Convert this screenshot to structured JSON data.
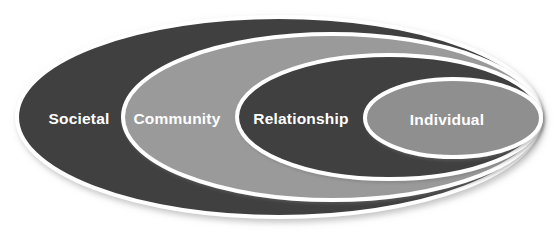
{
  "diagram": {
    "name": "social-ecological-model",
    "background_color": "#ffffff",
    "outline_color": "#ffffff",
    "shadow_color": "#b9b9b9",
    "levels": [
      {
        "label": "Societal",
        "fill": "#3f3f3f",
        "order": 1,
        "scope": "outermost",
        "cx": 279,
        "cy": 117,
        "rx": 262,
        "ry": 100,
        "label_x": 79,
        "label_y": 120
      },
      {
        "label": "Community",
        "fill": "#9a9a9a",
        "order": 2,
        "scope": "second",
        "cx": 332,
        "cy": 117,
        "rx": 209,
        "ry": 83,
        "label_x": 177,
        "label_y": 120
      },
      {
        "label": "Relationship",
        "fill": "#3f3f3f",
        "order": 3,
        "scope": "third",
        "cx": 389,
        "cy": 117,
        "rx": 152,
        "ry": 62,
        "label_x": 301,
        "label_y": 120
      },
      {
        "label": "Individual",
        "fill": "#8f8f8f",
        "order": 4,
        "scope": "innermost",
        "cx": 453,
        "cy": 118,
        "rx": 88,
        "ry": 39,
        "label_x": 447,
        "label_y": 121
      }
    ]
  },
  "chart_data": {
    "type": "diagram",
    "subtype": "nested-ellipses",
    "title": "",
    "categories": [
      "Societal",
      "Community",
      "Relationship",
      "Individual"
    ],
    "values": [
      1,
      2,
      3,
      4
    ],
    "legend_position": "none"
  }
}
